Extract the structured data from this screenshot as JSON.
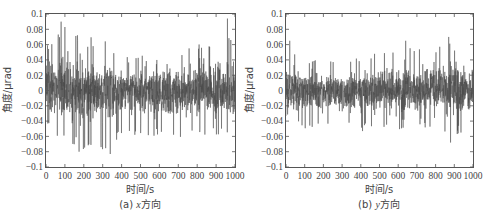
{
  "chart_data": [
    {
      "type": "line",
      "panel_id": "a",
      "caption": "(a) x方向",
      "caption_prefix": "(a) ",
      "caption_var": "x",
      "caption_suffix": "方向",
      "title": "",
      "xlabel": "时间/s",
      "ylabel": "角度/μrad",
      "xlim": [
        0,
        1000
      ],
      "ylim": [
        -0.1,
        0.1
      ],
      "xticks": [
        0,
        100,
        200,
        300,
        400,
        500,
        600,
        700,
        800,
        900,
        1000
      ],
      "yticks": [
        -0.1,
        -0.08,
        -0.06,
        -0.04,
        -0.02,
        0,
        0.02,
        0.04,
        0.06,
        0.08,
        0.1
      ],
      "ytick_labels": [
        "−0.1",
        "−0.08",
        "−0.06",
        "−0.04",
        "−0.02",
        "0",
        "0.02",
        "0.04",
        "0.06",
        "0.08",
        "0.1"
      ],
      "grid": false,
      "legend": null,
      "series": [
        {
          "name": "x方向角度",
          "color": "#4a4a4a",
          "description": "Dense random angular jitter signal around 0",
          "mean": 0.0,
          "approx_peak_max": 0.092,
          "approx_peak_min": -0.083,
          "notable_peaks": [
            {
              "x": 80,
              "y": 0.09
            },
            {
              "x": 100,
              "y": 0.083
            },
            {
              "x": 175,
              "y": -0.08
            },
            {
              "x": 340,
              "y": -0.083
            },
            {
              "x": 960,
              "y": 0.094
            }
          ],
          "envelope": {
            "x": [
              0,
              100,
              200,
              300,
              400,
              500,
              600,
              700,
              800,
              900,
              1000
            ],
            "upper": [
              0.06,
              0.085,
              0.07,
              0.07,
              0.045,
              0.045,
              0.05,
              0.05,
              0.06,
              0.075,
              0.07
            ],
            "lower": [
              -0.05,
              -0.07,
              -0.08,
              -0.08,
              -0.06,
              -0.06,
              -0.06,
              -0.065,
              -0.06,
              -0.06,
              -0.06
            ]
          }
        }
      ]
    },
    {
      "type": "line",
      "panel_id": "b",
      "caption": "(b) y方向",
      "caption_prefix": "(b) ",
      "caption_var": "y",
      "caption_suffix": "方向",
      "title": "",
      "xlabel": "时间/s",
      "ylabel": "角度/μrad",
      "xlim": [
        0,
        1000
      ],
      "ylim": [
        -0.1,
        0.1
      ],
      "xticks": [
        0,
        100,
        200,
        300,
        400,
        500,
        600,
        700,
        800,
        900,
        1000
      ],
      "yticks": [
        -0.1,
        -0.08,
        -0.06,
        -0.04,
        -0.02,
        0,
        0.02,
        0.04,
        0.06,
        0.08,
        0.1
      ],
      "ytick_labels": [
        "−0.1",
        "−0.08",
        "−0.06",
        "−0.04",
        "−0.02",
        "0",
        "0.02",
        "0.04",
        "0.06",
        "0.08",
        "0.1"
      ],
      "grid": false,
      "legend": null,
      "series": [
        {
          "name": "y方向角度",
          "color": "#4a4a4a",
          "description": "Dense random angular jitter signal around 0, smaller amplitude than x",
          "mean": 0.0,
          "approx_peak_max": 0.07,
          "approx_peak_min": -0.068,
          "notable_peaks": [
            {
              "x": 20,
              "y": 0.065
            },
            {
              "x": 640,
              "y": 0.065
            },
            {
              "x": 870,
              "y": 0.07
            },
            {
              "x": 880,
              "y": -0.068
            }
          ],
          "envelope": {
            "x": [
              0,
              100,
              200,
              300,
              400,
              500,
              600,
              700,
              800,
              900,
              1000
            ],
            "upper": [
              0.05,
              0.045,
              0.04,
              0.04,
              0.045,
              0.05,
              0.06,
              0.06,
              0.06,
              0.065,
              0.05
            ],
            "lower": [
              -0.04,
              -0.05,
              -0.05,
              -0.05,
              -0.055,
              -0.05,
              -0.055,
              -0.05,
              -0.05,
              -0.065,
              -0.05
            ]
          }
        }
      ]
    }
  ]
}
